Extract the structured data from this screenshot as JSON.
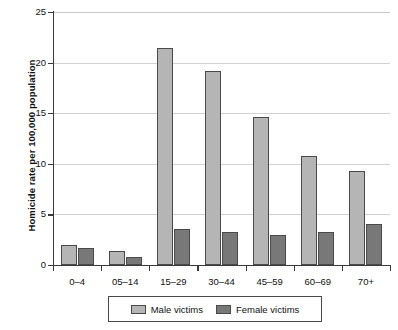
{
  "chart_data": {
    "type": "bar",
    "title": "",
    "xlabel": "",
    "ylabel": "Homicide rate per 100,000 population",
    "categories": [
      "0–4",
      "05–14",
      "15–29",
      "30–44",
      "45–59",
      "60–69",
      "70+"
    ],
    "series": [
      {
        "name": "Male victims",
        "color": "#b5b5b5",
        "values": [
          2.0,
          1.4,
          21.4,
          19.2,
          14.6,
          10.8,
          9.3
        ]
      },
      {
        "name": "Female victims",
        "color": "#787878",
        "values": [
          1.7,
          0.75,
          3.6,
          3.3,
          3.0,
          3.3,
          4.1
        ]
      }
    ],
    "ylim": [
      0,
      25
    ],
    "yticks": [
      0,
      5,
      10,
      15,
      20,
      25
    ],
    "ytick_labels": [
      "0",
      "5",
      "10",
      "15",
      "20",
      "25"
    ],
    "grid": "horizontal",
    "legend_position": "bottom-center",
    "legend_entries": [
      "Male victims",
      "Female victims"
    ]
  }
}
